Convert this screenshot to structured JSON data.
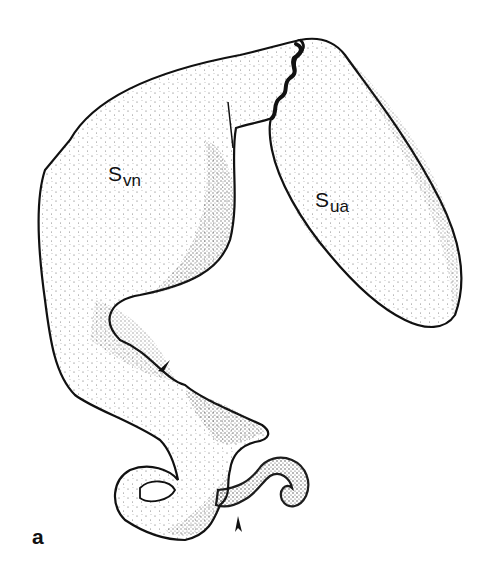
{
  "figure": {
    "panel_label": "a",
    "labels": {
      "svn": {
        "main": "S",
        "sub": "vn"
      },
      "sua": {
        "main": "S",
        "sub": "ua"
      }
    },
    "arrowheads": [
      {
        "name": "upper-arrowhead",
        "x": 163,
        "y": 368
      },
      {
        "name": "lower-arrowhead",
        "x": 238,
        "y": 524
      }
    ],
    "colors": {
      "ink": "#111111",
      "background": "#ffffff",
      "stipple": "#555555"
    }
  }
}
